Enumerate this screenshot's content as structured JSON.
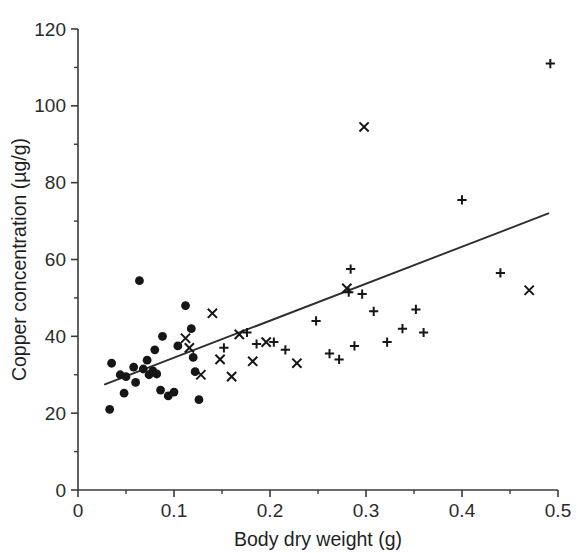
{
  "chart_data": {
    "type": "scatter",
    "title": "",
    "xlabel": "Body dry weight (g)",
    "ylabel": "Copper concentration (µg/g)",
    "xlim": [
      0,
      0.5
    ],
    "ylim": [
      0,
      120
    ],
    "x_major_ticks": [
      0,
      0.1,
      0.2,
      0.3,
      0.4,
      0.5
    ],
    "x_major_tick_labels": [
      "0",
      "0.1",
      "0.2",
      "0.3",
      "0.4",
      "0.5"
    ],
    "x_minor_ticks": [
      0.05,
      0.15,
      0.25,
      0.35,
      0.45
    ],
    "y_major_ticks": [
      0,
      20,
      40,
      60,
      80,
      100,
      120
    ],
    "y_major_tick_labels": [
      "0",
      "20",
      "40",
      "60",
      "80",
      "100",
      "120"
    ],
    "y_minor_ticks": [
      10,
      30,
      50,
      70,
      90,
      110
    ],
    "grid": false,
    "legend": null,
    "legend_position": "none",
    "marker_colors": {
      "circle": "#161616",
      "cross": "#161616",
      "plus": "#161616",
      "fit_line": "#2e2e2e",
      "axis": "#3a3a3a"
    },
    "trend_line": {
      "type": "linear-regression",
      "x_start": 0.028,
      "y_start": 27.5,
      "x_end": 0.49,
      "y_end": 72.0
    },
    "series": [
      {
        "name": "Group 1",
        "marker": "circle",
        "points": [
          [
            0.033,
            21.0
          ],
          [
            0.035,
            33.0
          ],
          [
            0.044,
            30.0
          ],
          [
            0.048,
            25.2
          ],
          [
            0.05,
            29.5
          ],
          [
            0.058,
            32.0
          ],
          [
            0.06,
            28.0
          ],
          [
            0.064,
            54.5
          ],
          [
            0.068,
            31.5
          ],
          [
            0.072,
            33.8
          ],
          [
            0.074,
            30.0
          ],
          [
            0.078,
            31.0
          ],
          [
            0.08,
            36.5
          ],
          [
            0.082,
            30.2
          ],
          [
            0.086,
            26.0
          ],
          [
            0.088,
            40.0
          ],
          [
            0.094,
            24.5
          ],
          [
            0.1,
            25.5
          ],
          [
            0.104,
            37.5
          ],
          [
            0.112,
            48.0
          ],
          [
            0.118,
            42.0
          ],
          [
            0.12,
            34.5
          ],
          [
            0.122,
            30.8
          ],
          [
            0.126,
            23.5
          ]
        ]
      },
      {
        "name": "Group 2",
        "marker": "cross",
        "points": [
          [
            0.112,
            39.5
          ],
          [
            0.116,
            37.0
          ],
          [
            0.128,
            30.0
          ],
          [
            0.14,
            46.0
          ],
          [
            0.148,
            34.0
          ],
          [
            0.16,
            29.5
          ],
          [
            0.168,
            40.5
          ],
          [
            0.182,
            33.5
          ],
          [
            0.196,
            38.5
          ],
          [
            0.228,
            33.0
          ],
          [
            0.28,
            52.5
          ],
          [
            0.298,
            94.5
          ],
          [
            0.47,
            52.0
          ]
        ]
      },
      {
        "name": "Group 3",
        "marker": "plus",
        "points": [
          [
            0.152,
            37.0
          ],
          [
            0.176,
            41.0
          ],
          [
            0.186,
            38.0
          ],
          [
            0.204,
            38.5
          ],
          [
            0.216,
            36.5
          ],
          [
            0.248,
            44.0
          ],
          [
            0.262,
            35.5
          ],
          [
            0.272,
            34.0
          ],
          [
            0.284,
            57.5
          ],
          [
            0.282,
            51.5
          ],
          [
            0.288,
            37.5
          ],
          [
            0.296,
            51.0
          ],
          [
            0.308,
            46.5
          ],
          [
            0.322,
            38.5
          ],
          [
            0.338,
            42.0
          ],
          [
            0.352,
            47.0
          ],
          [
            0.36,
            41.0
          ],
          [
            0.4,
            75.5
          ],
          [
            0.44,
            56.5
          ],
          [
            0.492,
            111.0
          ]
        ]
      }
    ]
  },
  "axes_text": {
    "xlabel": "Body dry weight (g)",
    "ylabel": "Copper concentration (µg/g)"
  }
}
